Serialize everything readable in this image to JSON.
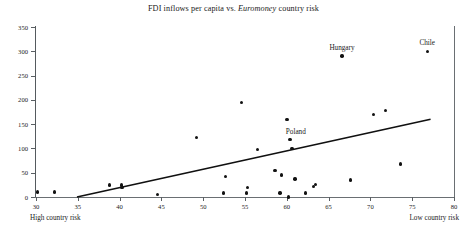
{
  "chart_data": {
    "type": "scatter",
    "title": "FDI inflows per capita vs. Euromoney country risk",
    "title_plain": "FDI inflows per capita vs. ",
    "title_italic": "Euromoney",
    "title_tail": " country risk",
    "xlabel": "",
    "ylabel": "",
    "xlim": [
      30,
      80
    ],
    "ylim": [
      0,
      350
    ],
    "xticks": [
      30,
      35,
      40,
      45,
      50,
      55,
      60,
      65,
      70,
      75,
      80
    ],
    "yticks": [
      0,
      50,
      100,
      150,
      200,
      250,
      300,
      350
    ],
    "grid": false,
    "legend": "none",
    "x_axis_left_caption": "High country risk",
    "x_axis_right_caption": "Low country risk",
    "points": [
      {
        "x": 30.2,
        "y": 10
      },
      {
        "x": 32.2,
        "y": 10
      },
      {
        "x": 38.8,
        "y": 25
      },
      {
        "x": 40.2,
        "y": 25
      },
      {
        "x": 40.3,
        "y": 20
      },
      {
        "x": 44.5,
        "y": 5
      },
      {
        "x": 49.2,
        "y": 122
      },
      {
        "x": 52.4,
        "y": 8
      },
      {
        "x": 52.7,
        "y": 42
      },
      {
        "x": 54.6,
        "y": 195
      },
      {
        "x": 55.2,
        "y": 8
      },
      {
        "x": 55.3,
        "y": 20
      },
      {
        "x": 56.5,
        "y": 98
      },
      {
        "x": 58.6,
        "y": 55
      },
      {
        "x": 59.2,
        "y": 8
      },
      {
        "x": 59.4,
        "y": 45
      },
      {
        "x": 60.0,
        "y": 160
      },
      {
        "x": 60.2,
        "y": 0
      },
      {
        "x": 60.4,
        "y": 118
      },
      {
        "x": 60.6,
        "y": 100
      },
      {
        "x": 61.0,
        "y": 37
      },
      {
        "x": 62.2,
        "y": 8
      },
      {
        "x": 63.2,
        "y": 22
      },
      {
        "x": 63.4,
        "y": 26
      },
      {
        "x": 66.6,
        "y": 290
      },
      {
        "x": 67.6,
        "y": 35
      },
      {
        "x": 70.4,
        "y": 170
      },
      {
        "x": 71.8,
        "y": 178
      },
      {
        "x": 73.6,
        "y": 68
      },
      {
        "x": 76.8,
        "y": 300
      }
    ],
    "annotations": [
      {
        "label": "Hungary",
        "x": 66.6,
        "y": 290,
        "dx": 0,
        "dy": 12
      },
      {
        "label": "Chile",
        "x": 76.8,
        "y": 300,
        "dx": 0,
        "dy": 12
      },
      {
        "label": "Poland",
        "x": 60.6,
        "y": 100,
        "dx": 4,
        "dy": 20
      }
    ],
    "trendline": {
      "x0": 34.9,
      "y0": 0,
      "x1": 77.2,
      "y1": 160
    }
  }
}
